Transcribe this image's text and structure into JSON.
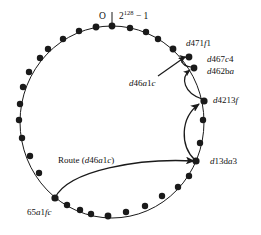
{
  "figure": {
    "type": "dht-ring-routing-diagram",
    "ring": {
      "origin_label": "O",
      "max_label_base": "2",
      "max_label_exp": "128",
      "max_label_tail": " − 1",
      "max_label_full": "2128 − 1",
      "center_x": 112,
      "center_y": 122,
      "radius_x": 92,
      "radius_y": 96
    },
    "node_labels": [
      {
        "id": "d471f1",
        "text": "d471f1",
        "x": 186,
        "y": 43
      },
      {
        "id": "d467c4",
        "text": "d467c4",
        "x": 207,
        "y": 60
      },
      {
        "id": "d462ba",
        "text": "d462ba",
        "x": 207,
        "y": 71
      },
      {
        "id": "d46a1c",
        "text": "d46a1c",
        "x": 131,
        "y": 80
      },
      {
        "id": "d4213f",
        "text": "d4213f",
        "x": 214,
        "y": 98
      },
      {
        "id": "d13da3",
        "text": "d13da3",
        "x": 212,
        "y": 158
      },
      {
        "id": "route",
        "text": "Route (d46a1c)",
        "x": 59,
        "y": 157
      },
      {
        "id": "65a1fc",
        "text": "65a1fc",
        "x": 28,
        "y": 209
      }
    ],
    "ring_nodes": [
      {
        "x": 112,
        "y": 26
      },
      {
        "x": 96,
        "y": 27
      },
      {
        "x": 130,
        "y": 28
      },
      {
        "x": 79,
        "y": 31
      },
      {
        "x": 146,
        "y": 32
      },
      {
        "x": 63,
        "y": 39
      },
      {
        "x": 158,
        "y": 39
      },
      {
        "x": 48,
        "y": 49
      },
      {
        "x": 44,
        "y": 55
      },
      {
        "x": 172,
        "y": 49
      },
      {
        "x": 31,
        "y": 70
      },
      {
        "x": 187,
        "y": 58
      },
      {
        "x": 193,
        "y": 68
      },
      {
        "x": 23,
        "y": 86
      },
      {
        "x": 20,
        "y": 103
      },
      {
        "x": 204,
        "y": 101
      },
      {
        "x": 19,
        "y": 119
      },
      {
        "x": 203,
        "y": 119
      },
      {
        "x": 22,
        "y": 137
      },
      {
        "x": 200,
        "y": 142
      },
      {
        "x": 30,
        "y": 155
      },
      {
        "x": 196,
        "y": 160
      },
      {
        "x": 34,
        "y": 163
      },
      {
        "x": 189,
        "y": 175
      },
      {
        "x": 54,
        "y": 199
      },
      {
        "x": 178,
        "y": 186
      },
      {
        "x": 66,
        "y": 203
      },
      {
        "x": 160,
        "y": 196
      },
      {
        "x": 78,
        "y": 209
      },
      {
        "x": 144,
        "y": 206
      },
      {
        "x": 88,
        "y": 213
      },
      {
        "x": 124,
        "y": 212
      },
      {
        "x": 106,
        "y": 215
      }
    ],
    "route_hops": [
      {
        "from": "65a1fc",
        "to": "d13da3"
      },
      {
        "from": "d13da3",
        "to": "d4213f"
      },
      {
        "from": "d4213f",
        "to": "d462ba"
      },
      {
        "from": "d462ba",
        "to": "d467c4"
      }
    ],
    "colors": {
      "stroke": "#1a1a1a",
      "node_fill": "#1a1a1a",
      "text": "#111111",
      "background": "#ffffff"
    }
  }
}
